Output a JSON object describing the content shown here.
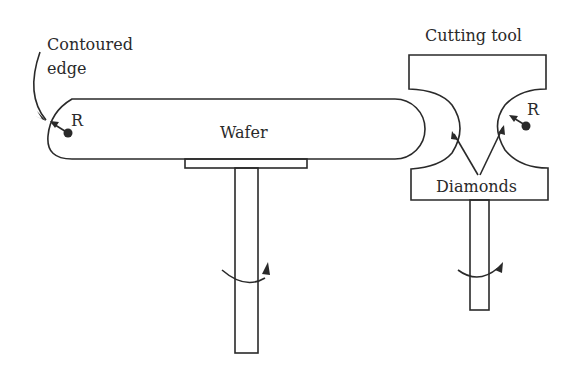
{
  "labels": {
    "contoured_edge_line1": "Contoured",
    "contoured_edge_line2": "edge",
    "wafer": "Wafer",
    "cutting_tool": "Cutting tool",
    "diamonds": "Diamonds",
    "radius_wafer": "R",
    "radius_tool": "R"
  },
  "colors": {
    "stroke": "#2a2a2a",
    "background": "#ffffff"
  }
}
